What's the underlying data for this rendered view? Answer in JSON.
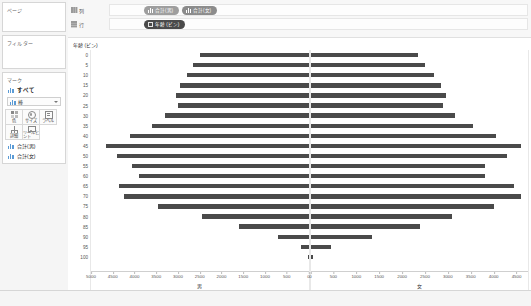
{
  "panels": {
    "pages": {
      "title": "ページ"
    },
    "filters": {
      "title": "フィルター"
    },
    "marks": {
      "title": "マーク",
      "all_label": "すべて",
      "all_icon": "bar-chart-icon",
      "type_label": "棒",
      "type_icon": "bar-mark-icon",
      "buttons": [
        {
          "name": "color",
          "label": "色",
          "icon": "color-palette-icon"
        },
        {
          "name": "size",
          "label": "サイズ",
          "icon": "size-circle-icon"
        },
        {
          "name": "label",
          "label": "ラベル",
          "icon": "label-box-icon"
        },
        {
          "name": "detail",
          "label": "詳細",
          "icon": "detail-hierarchy-icon"
        },
        {
          "name": "tooltip",
          "label": "ツールヒント",
          "icon": "tooltip-bubble-icon"
        }
      ],
      "fields": [
        {
          "label": "合計(男)",
          "icon": "bar-chart-icon"
        },
        {
          "label": "合計(女)",
          "icon": "bar-chart-icon"
        }
      ]
    }
  },
  "shelves": {
    "columns": {
      "label": "列",
      "icon": "columns-icon",
      "pills": [
        {
          "label": "合計(男)",
          "color": "#9e9e9e",
          "icon": "bars-icon"
        },
        {
          "label": "合計(女)",
          "color": "#8c8c8c",
          "icon": "bars-icon"
        }
      ]
    },
    "rows": {
      "label": "行",
      "icon": "rows-icon",
      "pills": [
        {
          "label": "年齢 (ビン)",
          "color": "#4a4a4a",
          "icon": "bin-icon"
        }
      ]
    }
  },
  "colors": {
    "bar": "#4a4a4a",
    "axis": "#555555",
    "grid": "#e8e8e8",
    "panel_bg": "#f5f5f5"
  },
  "chart_data": {
    "type": "bar",
    "title": "",
    "subtitle": "",
    "ylabel": "年齢 (ビン)",
    "grid": false,
    "legend": "none",
    "layout": "population-pyramid, two side-by-side horizontal bar panels sharing the age-bin axis",
    "categories": [
      0,
      5,
      10,
      15,
      20,
      25,
      30,
      35,
      40,
      45,
      50,
      55,
      60,
      65,
      70,
      75,
      80,
      85,
      90,
      95,
      100
    ],
    "category_labels": [
      "0",
      "5",
      "10",
      "15",
      "20",
      "25",
      "30",
      "35",
      "40",
      "45",
      "50",
      "55",
      "60",
      "65",
      "70",
      "75",
      "80",
      "85",
      "90",
      "95",
      "100"
    ],
    "panels": [
      {
        "name": "male",
        "xlabel": "男",
        "xlim": [
          0,
          5000
        ],
        "xticks": [
          0,
          500,
          1000,
          1500,
          2000,
          2500,
          3000,
          3500,
          4000,
          4500,
          5000
        ],
        "xtick_labels": [
          "0",
          "500",
          "1000",
          "1500",
          "2000",
          "2500",
          "3000",
          "3500",
          "4000",
          "4500",
          "5000"
        ],
        "direction": "right-to-left",
        "series_name": "合計(男)",
        "values": [
          2500,
          2650,
          2800,
          2950,
          3050,
          3000,
          3300,
          3600,
          4100,
          4650,
          4400,
          4050,
          3900,
          4350,
          4250,
          3450,
          2450,
          1600,
          700,
          180,
          20
        ]
      },
      {
        "name": "female",
        "xlabel": "女",
        "xlim": [
          0,
          4750
        ],
        "xticks": [
          0,
          500,
          1000,
          1500,
          2000,
          2500,
          3000,
          3500,
          4000,
          4500
        ],
        "xtick_labels": [
          "0",
          "500",
          "1000",
          "1500",
          "2000",
          "2500",
          "3000",
          "3500",
          "4000",
          "4500"
        ],
        "direction": "left-to-right",
        "series_name": "合計(女)",
        "values": [
          2350,
          2500,
          2700,
          2850,
          2950,
          2900,
          3150,
          3550,
          4050,
          4600,
          4300,
          3800,
          3800,
          4450,
          4600,
          4000,
          3100,
          2400,
          1350,
          450,
          60
        ]
      }
    ]
  }
}
